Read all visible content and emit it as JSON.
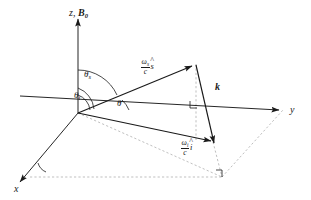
{
  "figure": {
    "name": "scattering-geometry-diagram",
    "type": "3d-vector-diagram",
    "background_color": "#ffffff",
    "stroke_color": "#1a1a1a",
    "dash_color": "#9a9a9a",
    "width": 311,
    "height": 200
  },
  "axes": {
    "z": {
      "label_z": "z",
      "separator": ",",
      "label_b": "B",
      "label_b_sub": "0",
      "full": "z, B0",
      "direction": "up"
    },
    "y": {
      "label": "y",
      "direction": "right"
    },
    "x": {
      "label": "x",
      "direction": "lower-left"
    }
  },
  "angles": [
    {
      "name": "theta-s",
      "symbol": "θ",
      "subscript": "s",
      "description": "scattering angle from z axis"
    },
    {
      "name": "theta-i",
      "symbol": "θ",
      "subscript": "i",
      "description": "incidence angle from z axis"
    },
    {
      "name": "theta",
      "symbol": "θ",
      "subscript": "",
      "description": "angle in plane from y axis"
    }
  ],
  "vectors": [
    {
      "name": "scattered-wavevector",
      "numerator": "ω",
      "numerator_sub": "s",
      "denominator": "c",
      "unit": "s",
      "hat": "^",
      "full": "(ωs/c) ŝ"
    },
    {
      "name": "incident-wavevector",
      "numerator": "ω",
      "numerator_sub": "i",
      "denominator": "c",
      "unit": "i",
      "hat": "^",
      "full": "(ωi/c) î"
    },
    {
      "name": "k-vector",
      "label": "k",
      "full": "k"
    }
  ],
  "markers": {
    "right_angle_upper": "right-angle",
    "right_angle_lower": "right-angle",
    "x_axis_arc": "angle-arc"
  }
}
